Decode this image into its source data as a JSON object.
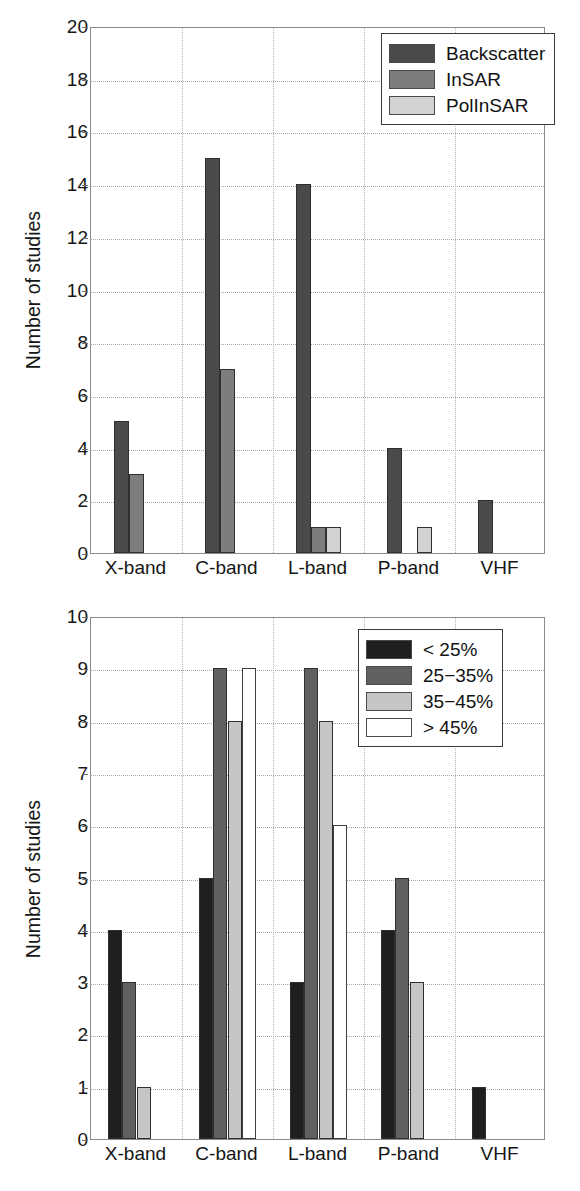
{
  "figure": {
    "panels": [
      {
        "id": "top",
        "ylabel": "Number of studies",
        "yticks": [
          "0",
          "2",
          "4",
          "6",
          "8",
          "10",
          "12",
          "14",
          "16",
          "18",
          "20"
        ],
        "xticks": [
          "X-band",
          "C-band",
          "L-band",
          "P-band",
          "VHF"
        ],
        "legend": [
          {
            "label": "Backscatter",
            "color": "#4a4a4a"
          },
          {
            "label": "InSAR",
            "color": "#7d7d7d"
          },
          {
            "label": "PolInSAR",
            "color": "#d2d2d2"
          }
        ]
      },
      {
        "id": "bottom",
        "ylabel": "Number of studies",
        "yticks": [
          "0",
          "1",
          "2",
          "3",
          "4",
          "5",
          "6",
          "7",
          "8",
          "9",
          "10"
        ],
        "xticks": [
          "X-band",
          "C-band",
          "L-band",
          "P-band",
          "VHF"
        ],
        "legend": [
          {
            "label": "< 25%",
            "color": "#1f1f1f"
          },
          {
            "label": "25−35%",
            "color": "#606060"
          },
          {
            "label": "35−45%",
            "color": "#c6c6c6"
          },
          {
            "label": "> 45%",
            "color": "#ffffff"
          }
        ]
      }
    ]
  },
  "chart_data": [
    {
      "type": "bar",
      "panel": "top",
      "title": "",
      "xlabel": "",
      "ylabel": "Number of studies",
      "ylim": [
        0,
        20
      ],
      "ytick_step": 2,
      "grid": true,
      "legend_position": "top-right",
      "categories": [
        "X-band",
        "C-band",
        "L-band",
        "P-band",
        "VHF"
      ],
      "series": [
        {
          "name": "Backscatter",
          "color": "#4a4a4a",
          "values": [
            5,
            15,
            14,
            4,
            2
          ]
        },
        {
          "name": "InSAR",
          "color": "#7d7d7d",
          "values": [
            3,
            7,
            1,
            0,
            0
          ]
        },
        {
          "name": "PolInSAR",
          "color": "#d2d2d2",
          "values": [
            0,
            0,
            1,
            1,
            0
          ]
        }
      ]
    },
    {
      "type": "bar",
      "panel": "bottom",
      "title": "",
      "xlabel": "",
      "ylabel": "Number of studies",
      "ylim": [
        0,
        10
      ],
      "ytick_step": 1,
      "grid": true,
      "legend_position": "top-right",
      "categories": [
        "X-band",
        "C-band",
        "L-band",
        "P-band",
        "VHF"
      ],
      "series": [
        {
          "name": "< 25%",
          "color": "#1f1f1f",
          "values": [
            4,
            5,
            3,
            4,
            1
          ]
        },
        {
          "name": "25−35%",
          "color": "#606060",
          "values": [
            3,
            9,
            9,
            5,
            0
          ]
        },
        {
          "name": "35−45%",
          "color": "#c6c6c6",
          "values": [
            1,
            8,
            8,
            3,
            0
          ]
        },
        {
          "name": "> 45%",
          "color": "#ffffff",
          "values": [
            0,
            9,
            6,
            0,
            0
          ]
        }
      ]
    }
  ]
}
